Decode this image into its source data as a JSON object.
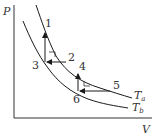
{
  "diagram": {
    "type": "pv-diagram",
    "axes": {
      "y_label": "P",
      "x_label": "V"
    },
    "isotherms": [
      {
        "name": "T_a",
        "label_main": "T",
        "label_sub": "a"
      },
      {
        "name": "T_b",
        "label_main": "T",
        "label_sub": "b"
      }
    ],
    "points": [
      {
        "id": "1",
        "label": "1"
      },
      {
        "id": "2",
        "label": "2"
      },
      {
        "id": "3",
        "label": "3"
      },
      {
        "id": "4",
        "label": "4"
      },
      {
        "id": "5",
        "label": "5"
      },
      {
        "id": "6",
        "label": "6"
      }
    ],
    "processes": [
      {
        "from": "2",
        "to": "3",
        "kind": "isobaric",
        "direction": "left"
      },
      {
        "from": "3",
        "to": "1",
        "kind": "isochoric",
        "direction": "up"
      },
      {
        "from": "5",
        "to": "6",
        "kind": "isobaric",
        "direction": "left"
      },
      {
        "from": "6",
        "to": "4",
        "kind": "isochoric",
        "direction": "up"
      }
    ],
    "colors": {
      "line": "#1a1a1a",
      "text": "#333333"
    }
  }
}
